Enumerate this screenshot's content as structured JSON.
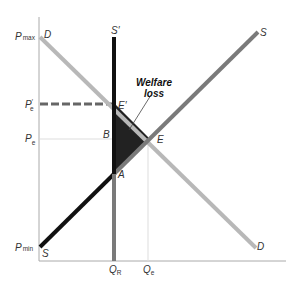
{
  "diagram": {
    "title": "",
    "y_labels": {
      "pmax": {
        "main": "P",
        "sub": "max"
      },
      "pe_prime": {
        "main": "P",
        "sub": "e",
        "prime": "′"
      },
      "pe": {
        "main": "P",
        "sub": "e"
      },
      "pmin": {
        "main": "P",
        "sub": "min"
      }
    },
    "x_labels": {
      "qr": {
        "main": "Q",
        "sub": "R"
      },
      "qe": {
        "main": "Q",
        "sub": "e"
      }
    },
    "curve_labels": {
      "demand_top": "D",
      "demand_bottom": "D",
      "supply_top": "S",
      "supply_bottom": "S",
      "supply_restricted": "S′"
    },
    "point_labels": {
      "e_prime": "E′",
      "e": "E",
      "a": "A",
      "b": "B"
    },
    "annotation": {
      "line1": "Welfare",
      "line2": "loss"
    },
    "colors": {
      "demand": "#b8b8b8",
      "supply": "#7a7a7a",
      "restricted_supply": "#111111",
      "restricted_supply_lower": "#7a7a7a",
      "welfare_loss_fill": "#222222",
      "axis": "#999999",
      "dashed": "#666666",
      "dotted": "#cccccc"
    }
  }
}
